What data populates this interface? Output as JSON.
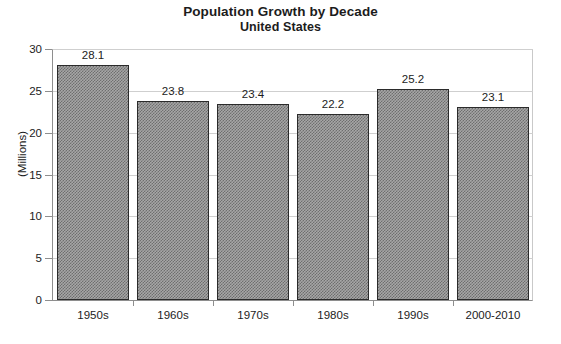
{
  "chart_data": {
    "type": "bar",
    "title": "Population Growth by Decade",
    "subtitle": "United States",
    "xlabel": "",
    "ylabel": "(Millions)",
    "categories": [
      "1950s",
      "1960s",
      "1970s",
      "1980s",
      "1990s",
      "2000-2010"
    ],
    "values": [
      28.1,
      23.8,
      23.4,
      22.2,
      25.2,
      23.1
    ],
    "value_labels": [
      "28.1",
      "23.8",
      "23.4",
      "22.2",
      "25.2",
      "23.1"
    ],
    "ylim": [
      0,
      30
    ],
    "yticks": [
      0,
      5,
      10,
      15,
      20,
      25,
      30
    ],
    "ytick_labels": [
      "0",
      "5",
      "10",
      "15",
      "20",
      "25",
      "30"
    ],
    "grid": true,
    "legend": false,
    "bar_fill": "#a6a6a6",
    "bar_pattern": "checkerboard-dither",
    "bar_border": "#2b2b2b",
    "gridline_color": "#cfcfcf",
    "axis_color": "#8e8e8e",
    "background": "#ffffff",
    "text_color": "#1c1c1c"
  }
}
